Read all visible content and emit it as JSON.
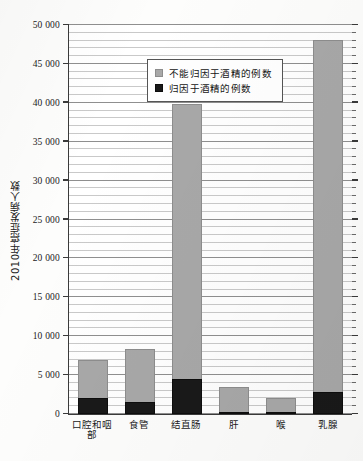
{
  "chart_data": {
    "type": "bar",
    "stacked": true,
    "title": "",
    "xlabel": "",
    "ylabel": "2010年癌症发病人数",
    "ylim": [
      0,
      50000
    ],
    "ytick_step": 5000,
    "minor_grid_step": 1000,
    "grid": true,
    "legend_position": "top-left-inside",
    "categories": [
      "口腔和咽部",
      "食管",
      "结直肠",
      "肝",
      "喉",
      "乳腺"
    ],
    "ytick_labels": [
      "0",
      "5 000",
      "10 000",
      "15 000",
      "20 000",
      "25 000",
      "30 000",
      "35 000",
      "40 000",
      "45 000",
      "50 000"
    ],
    "ytick_values": [
      0,
      5000,
      10000,
      15000,
      20000,
      25000,
      30000,
      35000,
      40000,
      45000,
      50000
    ],
    "series": [
      {
        "name": "归因于酒精的例数",
        "color": "#191919",
        "values": [
          2000,
          1600,
          4500,
          200,
          300,
          2800
        ]
      },
      {
        "name": "不能归因于酒精的例数",
        "color": "#a8a8a8",
        "values": [
          4900,
          6800,
          35300,
          3200,
          1700,
          45200
        ]
      }
    ],
    "totals": [
      6900,
      8400,
      39800,
      3400,
      2000,
      48000
    ]
  },
  "legend": {
    "items": [
      {
        "label": "不能归因于酒精的例数",
        "swatch": "gray"
      },
      {
        "label": "归因于酒精的例数",
        "swatch": "black"
      }
    ]
  },
  "colors": {
    "gray_series": "#a8a8a8",
    "black_series": "#191919",
    "axis": "#3a3a3a",
    "grid_minor": "#c9c9c9",
    "grid_major": "#8f8f8f",
    "background": "#ffffff"
  }
}
